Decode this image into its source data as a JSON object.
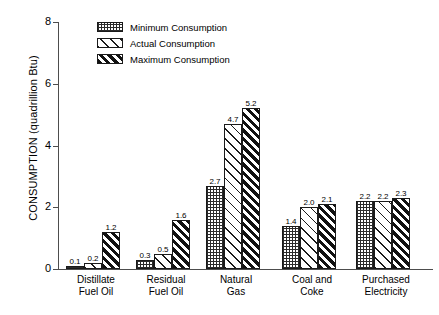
{
  "chart_data": {
    "type": "bar",
    "title": "",
    "xlabel": "",
    "ylabel": "CONSUMPTION (quadrillion Btu)",
    "ylim": [
      0,
      8
    ],
    "yticks": [
      "0",
      "2",
      "4",
      "6",
      "8"
    ],
    "grid": false,
    "legend_position": "top-left-inside",
    "categories": [
      "Distillate Fuel Oil",
      "Residual Fuel Oil",
      "Natural Gas",
      "Coal and Coke",
      "Purchased Electricity"
    ],
    "category_lines": [
      [
        "Distillate",
        "Fuel Oil"
      ],
      [
        "Residual",
        "Fuel Oil"
      ],
      [
        "Natural",
        "Gas"
      ],
      [
        "Coal and",
        "Coke"
      ],
      [
        "Purchased",
        "Electricity"
      ]
    ],
    "series": [
      {
        "name": "Minimum Consumption",
        "pattern": "dotted-grid",
        "values": [
          0.1,
          0.3,
          2.7,
          1.4,
          2.2
        ],
        "labels": [
          "0.1",
          "0.3",
          "2.7",
          "1.4",
          "2.2"
        ]
      },
      {
        "name": "Actual Consumption",
        "pattern": "sparse-diagonal",
        "values": [
          0.2,
          0.5,
          4.7,
          2.0,
          2.2
        ],
        "labels": [
          "0.2",
          "0.5",
          "4.7",
          "2.0",
          "2.2"
        ]
      },
      {
        "name": "Maximum Consumption",
        "pattern": "dense-diagonal",
        "values": [
          1.2,
          1.6,
          5.2,
          2.1,
          2.3
        ],
        "labels": [
          "1.2",
          "1.6",
          "5.2",
          "2.1",
          "2.3"
        ]
      }
    ]
  },
  "legend": {
    "items": [
      {
        "label": "Minimum Consumption"
      },
      {
        "label": "Actual Consumption"
      },
      {
        "label": "Maximum Consumption"
      }
    ]
  },
  "colors": {
    "background": "#ffffff",
    "ink": "#000000",
    "axis": "#4d4d4d",
    "hatch": "#1a1a1a"
  }
}
